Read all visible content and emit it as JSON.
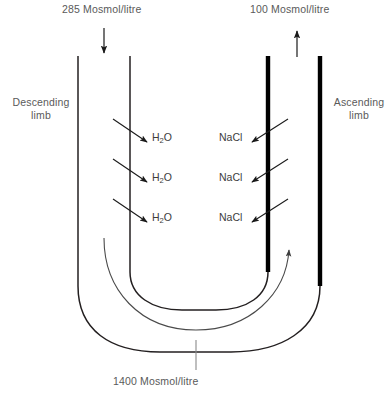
{
  "diagram": {
    "title_top_left": "285 Mosmol/litre",
    "title_top_right": "100 Mosmol/litre",
    "bottom_value": "1400 Mosmol/litre",
    "left_limb_label_line1": "Descending",
    "left_limb_label_line2": "limb",
    "right_limb_label_line1": "Ascending",
    "right_limb_label_line2": "limb",
    "water_label_base": "H",
    "water_label_sub": "2",
    "water_label_tail": "O",
    "salt_label": "NaCl",
    "exchanges": [
      {
        "water": "H2O",
        "salt": "NaCl"
      },
      {
        "water": "H2O",
        "salt": "NaCl"
      },
      {
        "water": "H2O",
        "salt": "NaCl"
      }
    ],
    "colors": {
      "thin_wall": "#231f20",
      "thick_wall": "#000000",
      "text": "#5a5a5a",
      "text_dark": "#3c3c3c",
      "arrow": "#1a1a1a",
      "flow_arrow": "#4a4a4a",
      "background": "#ffffff"
    },
    "geometry": {
      "descending_inflow_arrow": "down",
      "ascending_outflow_arrow": "up",
      "water_arrow_direction": "out-right-down",
      "salt_arrow_direction": "out-left-down",
      "internal_flow_direction": "counterclockwise-up-right"
    }
  }
}
